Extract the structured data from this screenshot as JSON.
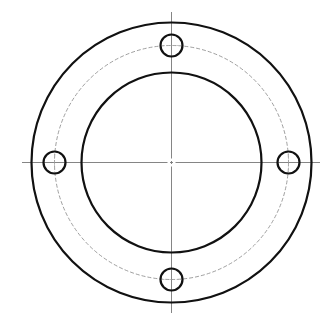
{
  "drawing": {
    "title": "Flange with 4 bolt holes",
    "center": {
      "x": 171.5,
      "y": 162.5
    },
    "outer_circle": {
      "r": 140,
      "stroke": "#111111",
      "width": 2.2
    },
    "inner_circle": {
      "r": 90,
      "stroke": "#111111",
      "width": 2.2
    },
    "bolt_circle": {
      "r": 117,
      "stroke": "#888888",
      "width": 0.8,
      "dash": "4 2"
    },
    "bolt_holes": {
      "count": 4,
      "r": 11,
      "stroke": "#111111",
      "width": 2.2,
      "angles_deg": [
        90,
        0,
        270,
        180
      ]
    },
    "center_lines": {
      "stroke": "#777777",
      "width": 0.9,
      "horizontal": {
        "x1": 22,
        "x2": 320
      },
      "vertical": {
        "y1": 12,
        "y2": 313
      },
      "center_gap": 4
    }
  }
}
